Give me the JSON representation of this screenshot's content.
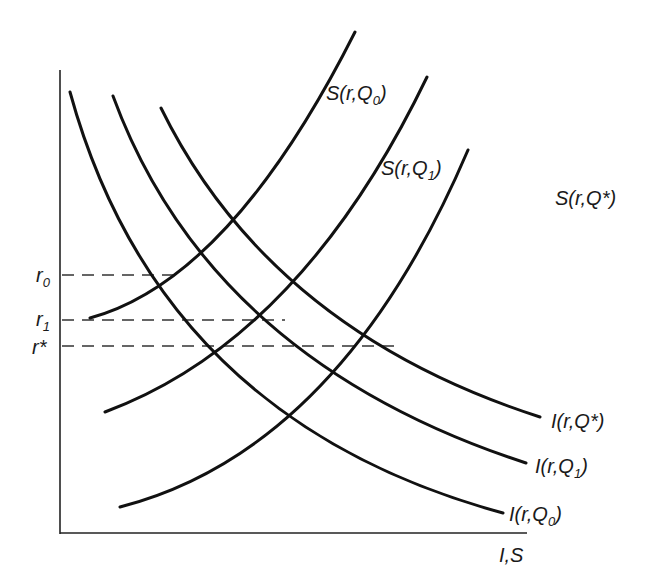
{
  "diagram": {
    "type": "supply-demand curves (investment/saving vs interest rate)",
    "axes": {
      "x_label": "I,S",
      "y_ticks": [
        {
          "id": "r0",
          "base": "r",
          "sub": "0",
          "label": "r0"
        },
        {
          "id": "r1",
          "base": "r",
          "sub": "1",
          "label": "r1"
        },
        {
          "id": "rstar",
          "base": "r*",
          "sub": "",
          "label": "r*"
        }
      ]
    },
    "supply_curves": [
      {
        "id": "S_Q0",
        "prefix": "S(r,Q",
        "sub": "0",
        "suffix": ")",
        "label": "S(r,Q0)"
      },
      {
        "id": "S_Q1",
        "prefix": "S(r,Q",
        "sub": "1",
        "suffix": ")",
        "label": "S(r,Q1)"
      },
      {
        "id": "S_Qstar",
        "prefix": "S(r,Q*",
        "sub": "",
        "suffix": ")",
        "label": "S(r,Q*)"
      }
    ],
    "investment_curves": [
      {
        "id": "I_Q0",
        "prefix": "I(r,Q",
        "sub": "0",
        "suffix": ")",
        "label": "I(r,Q0)"
      },
      {
        "id": "I_Q1",
        "prefix": "I(r,Q",
        "sub": "1",
        "suffix": ")",
        "label": "I(r,Q1)"
      },
      {
        "id": "I_Qstar",
        "prefix": "I(r,Q*",
        "sub": "",
        "suffix": ")",
        "label": "I(r,Q*)"
      }
    ],
    "equilibria": [
      {
        "rate": "r0",
        "pair": [
          "I(r,Q0)",
          "S(r,Q0)"
        ]
      },
      {
        "rate": "r1",
        "pair": [
          "I(r,Q1)",
          "S(r,Q1)"
        ]
      },
      {
        "rate": "r*",
        "pair": [
          "I(r,Q*)",
          "S(r,Q*)"
        ]
      }
    ]
  }
}
